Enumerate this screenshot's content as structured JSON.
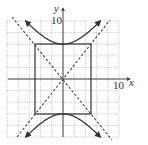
{
  "chart_data": {
    "type": "line",
    "title": "",
    "xlabel": "x",
    "ylabel": "y",
    "xlim": [
      -10,
      10
    ],
    "ylim": [
      -10,
      10
    ],
    "grid": true,
    "grid_step": 2,
    "x_tick_labels": [
      {
        "value": 10,
        "label": "10"
      }
    ],
    "y_tick_labels": [
      {
        "value": 10,
        "label": "10"
      }
    ],
    "series": [
      {
        "name": "hyperbola",
        "style": "solid",
        "equation": "y^2/36 - x^2/25 = 1",
        "vertices": [
          [
            0,
            6
          ],
          [
            0,
            -6
          ]
        ],
        "branches": [
          {
            "name": "upper",
            "x": [
              -6.67,
              -5,
              -3,
              0,
              3,
              5,
              6.67
            ],
            "y": [
              10,
              7.81,
              7.0,
              6,
              7.0,
              7.81,
              10
            ]
          },
          {
            "name": "lower",
            "x": [
              -6.67,
              -5,
              -3,
              0,
              3,
              5,
              6.67
            ],
            "y": [
              -10,
              -7.81,
              -7.0,
              -6,
              -7.0,
              -7.81,
              -10
            ]
          }
        ]
      },
      {
        "name": "asymptote-positive",
        "style": "dashed",
        "equation": "y = 1.2x",
        "x": [
          -9,
          9
        ],
        "y": [
          -10.8,
          10.8
        ]
      },
      {
        "name": "asymptote-negative",
        "style": "dashed",
        "equation": "y = -1.2x",
        "x": [
          -9,
          9
        ],
        "y": [
          10.8,
          -10.8
        ]
      },
      {
        "name": "fundamental-rectangle",
        "style": "solid",
        "x": [
          -5,
          5,
          5,
          -5,
          -5
        ],
        "y": [
          6,
          6,
          -6,
          -6,
          6
        ]
      }
    ]
  },
  "labels": {
    "x_axis": "x",
    "y_axis": "y",
    "x_tick": "10",
    "y_tick": "10"
  },
  "colors": {
    "curve": "#333333",
    "grid": "#9a9a9a",
    "axis": "#444444"
  }
}
